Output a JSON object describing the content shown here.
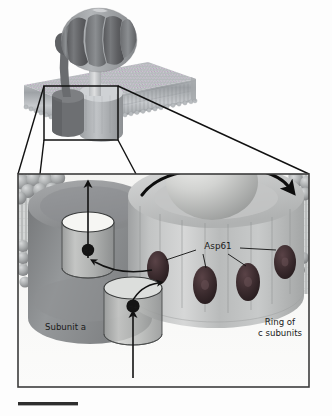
{
  "figure": {
    "overview_label": "",
    "detail_panel": {
      "labels": {
        "subunit_a": "Subunit a",
        "asp61": "Asp61",
        "ring_line1": "Ring of",
        "ring_line2": "c subunits"
      },
      "ion_label": "H+",
      "ion_count_visible": 2,
      "asp61_residue_count": 4,
      "asp61_leader_lines": 4
    },
    "arrows": {
      "proton_entry": "proton-entry-arrow-up",
      "proton_exit": "proton-exit-arrow-up",
      "transfer_lower": "curved-arrow-to-asp61",
      "transfer_upper": "curved-arrow-from-asp61",
      "rotation": "c-ring-rotation-arrow"
    },
    "scale_bar": {
      "visible": true,
      "caption": ""
    },
    "colors": {
      "membrane_head": "#9aa0a4",
      "membrane_tail": "#b9bdc0",
      "subunit_a": "#8d8f92",
      "c_ring": "#b4b6b6",
      "c_ring_light": "#c9cacb",
      "asp61_residue": "#3a2a2c",
      "f1_head_dark": "#6e6f72",
      "f1_head_light": "#9b9ea1",
      "outline": "#1a1a1a",
      "panel_border": "#3c3c3c",
      "ion": "#141414",
      "background": "#fdfdfd",
      "channel_fill": "#f2f2f0"
    }
  }
}
